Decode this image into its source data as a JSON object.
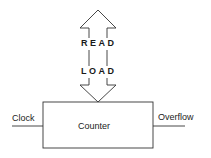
{
  "diagram": {
    "bus_arrow": {
      "top_label": "READ",
      "bottom_label": "LOAD"
    },
    "block": {
      "label": "Counter"
    },
    "input": {
      "label": "Clock"
    },
    "output": {
      "label": "Overflow"
    },
    "stroke_color": "#333333"
  }
}
